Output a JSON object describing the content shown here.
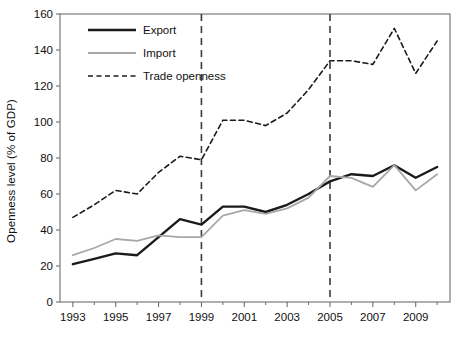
{
  "figure": {
    "background_color": "#ffffff",
    "frame_color": "#6e6e6e",
    "y_axis_title": "Openness level (% of GDP)"
  },
  "legend": {
    "position": "top-left-inside",
    "entries": [
      {
        "label": "Export",
        "color": "#1a1a1a",
        "style": "solid",
        "width": 2.6
      },
      {
        "label": "Import",
        "color": "#a8a8a8",
        "style": "solid",
        "width": 1.8
      },
      {
        "label": "Trade openness",
        "color": "#1a1a1a",
        "style": "dashed",
        "width": 1.5
      }
    ]
  },
  "annotations": {
    "vertical_lines": [
      {
        "name": "vline-1999",
        "x_value": 1999,
        "style": "dashed",
        "color": "#3c3c3c"
      },
      {
        "name": "vline-2005",
        "x_value": 2005,
        "style": "dashed",
        "color": "#3c3c3c"
      }
    ]
  },
  "axes": {
    "x": {
      "label": "",
      "min": 1992.4,
      "max": 2010.6,
      "tick_labels": [
        "1993",
        "1995",
        "1997",
        "1999",
        "2001",
        "2003",
        "2005",
        "2007",
        "2009"
      ],
      "tick_values": [
        1993,
        1995,
        1997,
        1999,
        2001,
        2003,
        2005,
        2007,
        2009
      ],
      "minor_tick_values": [
        1994,
        1996,
        1998,
        2000,
        2002,
        2004,
        2006,
        2008,
        2010
      ]
    },
    "y": {
      "label": "Openness level (% of GDP)",
      "min": 0,
      "max": 160,
      "tick_labels": [
        "0",
        "20",
        "40",
        "60",
        "80",
        "100",
        "120",
        "140",
        "160"
      ],
      "tick_values": [
        0,
        20,
        40,
        60,
        80,
        100,
        120,
        140,
        160
      ]
    },
    "grid": false
  },
  "chart_data": {
    "type": "line",
    "title": "",
    "subtitle": "",
    "xlabel": "",
    "ylabel": "Openness level (% of GDP)",
    "xlim": [
      1992.4,
      2010.6
    ],
    "ylim": [
      0,
      160
    ],
    "grid": false,
    "legend_position": "upper left (inside axes)",
    "x": [
      1993,
      1994,
      1995,
      1996,
      1997,
      1998,
      1999,
      2000,
      2001,
      2002,
      2003,
      2004,
      2005,
      2006,
      2007,
      2008,
      2009,
      2010
    ],
    "series": [
      {
        "name": "Export",
        "color": "#1a1a1a",
        "style": "solid",
        "values": [
          21,
          24,
          27,
          26,
          36,
          46,
          43,
          53,
          53,
          50,
          54,
          60,
          67,
          71,
          70,
          76,
          69,
          75
        ]
      },
      {
        "name": "Import",
        "color": "#a8a8a8",
        "style": "solid",
        "values": [
          26,
          30,
          35,
          34,
          37,
          36,
          36,
          48,
          51,
          49,
          52,
          58,
          70,
          69,
          64,
          76,
          62,
          71
        ]
      },
      {
        "name": "Trade openness",
        "color": "#1a1a1a",
        "style": "dashed",
        "values": [
          47,
          54,
          62,
          60,
          72,
          81,
          79,
          101,
          101,
          98,
          105,
          118,
          134,
          134,
          132,
          152,
          127,
          145
        ]
      }
    ],
    "annotations": [
      {
        "type": "vline",
        "x": 1999,
        "style": "dashed"
      },
      {
        "type": "vline",
        "x": 2005,
        "style": "dashed"
      }
    ]
  }
}
